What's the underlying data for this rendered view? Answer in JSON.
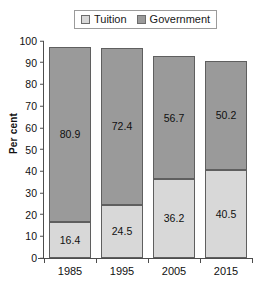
{
  "chart_data": {
    "type": "bar",
    "subtype": "stacked-bar",
    "title": "",
    "xlabel": "",
    "ylabel": "Per cent",
    "ylim": [
      0,
      100
    ],
    "ytick_step": 10,
    "grid": false,
    "legend_position": "top",
    "categories": [
      "1985",
      "1995",
      "2005",
      "2015"
    ],
    "ytick_labels": [
      "100",
      "90",
      "80",
      "70",
      "60",
      "50",
      "40",
      "30",
      "20",
      "10",
      "0"
    ],
    "series": [
      {
        "name": "Tuition",
        "color": "#d8d8d8",
        "values": [
          16.4,
          24.5,
          36.2,
          40.5
        ],
        "labels": [
          "16.4",
          "24.5",
          "36.2",
          "40.5"
        ]
      },
      {
        "name": "Government",
        "color": "#9a9a9a",
        "values": [
          80.9,
          72.4,
          56.7,
          50.2
        ],
        "labels": [
          "80.9",
          "72.4",
          "56.7",
          "50.2"
        ]
      }
    ],
    "totals": [
      97.3,
      96.9,
      92.9,
      90.7
    ]
  },
  "legend": {
    "entries": [
      {
        "label": "Tuition",
        "swatch": "tuition-swatch-icon"
      },
      {
        "label": "Government",
        "swatch": "government-swatch-icon"
      }
    ]
  },
  "axes": {
    "y_title": "Per cent"
  }
}
